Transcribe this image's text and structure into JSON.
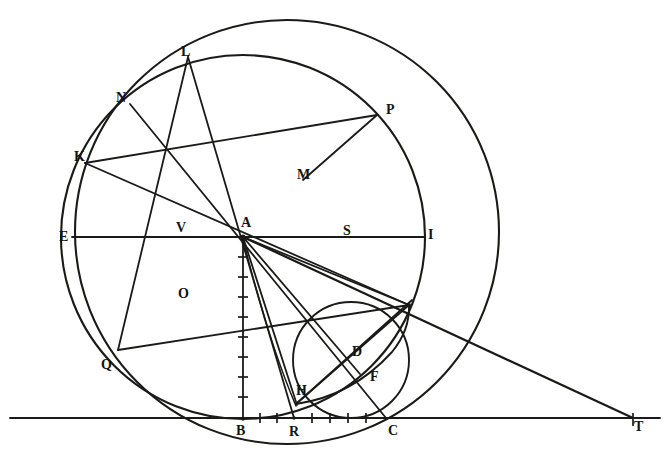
{
  "figure": {
    "kind": "geometric-construction-diagram",
    "medium": "scanned line drawing, black ink on white paper",
    "width": 667,
    "height": 465,
    "ink_color": "#1a1a18",
    "paper_color": "#ffffff"
  },
  "labels": [
    {
      "id": "L",
      "text": "L",
      "x": 181,
      "y": 45,
      "role": "circle-intersection-top"
    },
    {
      "id": "N",
      "text": "N",
      "x": 116,
      "y": 91,
      "role": "circle-point-upper-left"
    },
    {
      "id": "P",
      "text": "P",
      "x": 386,
      "y": 103,
      "role": "circle-point-upper-right"
    },
    {
      "id": "K",
      "text": "K",
      "x": 74,
      "y": 150,
      "role": "circle-point-left-upper"
    },
    {
      "id": "M",
      "text": "M",
      "x": 297,
      "y": 168,
      "role": "chord-intersection"
    },
    {
      "id": "E",
      "text": "E",
      "x": 59,
      "y": 230,
      "role": "diameter-left-end"
    },
    {
      "id": "V",
      "text": "V",
      "x": 176,
      "y": 221,
      "role": "chord-intersection-left"
    },
    {
      "id": "A",
      "text": "A",
      "x": 241,
      "y": 216,
      "role": "center"
    },
    {
      "id": "S",
      "text": "S",
      "x": 343,
      "y": 224,
      "role": "chord-intersection-right"
    },
    {
      "id": "I",
      "text": "I",
      "x": 428,
      "y": 228,
      "role": "diameter-right-end"
    },
    {
      "id": "O",
      "text": "O",
      "x": 178,
      "y": 287,
      "role": "chord-intersection-lower-left"
    },
    {
      "id": "Q",
      "text": "Q",
      "x": 101,
      "y": 358,
      "role": "circle-point-lower-left"
    },
    {
      "id": "D",
      "text": "D",
      "x": 352,
      "y": 345,
      "role": "small-circle-point"
    },
    {
      "id": "F",
      "text": "F",
      "x": 370,
      "y": 370,
      "role": "small-circle-point"
    },
    {
      "id": "H",
      "text": "H",
      "x": 296,
      "y": 384,
      "role": "near-baseline-point"
    },
    {
      "id": "B",
      "text": "B",
      "x": 236,
      "y": 424,
      "role": "tangent-point-baseline"
    },
    {
      "id": "R",
      "text": "R",
      "x": 289,
      "y": 425,
      "role": "baseline-point"
    },
    {
      "id": "C",
      "text": "C",
      "x": 388,
      "y": 424,
      "role": "baseline-point"
    },
    {
      "id": "T",
      "text": "T",
      "x": 634,
      "y": 420,
      "role": "baseline-right-end"
    }
  ],
  "points": {
    "A": {
      "x": 243,
      "y": 237
    },
    "B": {
      "x": 243,
      "y": 419
    },
    "R": {
      "x": 294,
      "y": 418
    },
    "C": {
      "x": 386,
      "y": 418
    },
    "T": {
      "x": 633,
      "y": 418
    },
    "E": {
      "x": 72,
      "y": 237
    },
    "I": {
      "x": 425,
      "y": 237
    },
    "K": {
      "x": 85,
      "y": 163
    },
    "L": {
      "x": 188,
      "y": 57
    },
    "N": {
      "x": 130,
      "y": 104
    },
    "P": {
      "x": 377,
      "y": 115
    },
    "M": {
      "x": 303,
      "y": 180
    },
    "V": {
      "x": 188,
      "y": 237
    },
    "S": {
      "x": 333,
      "y": 237
    },
    "O": {
      "x": 190,
      "y": 297
    },
    "Q": {
      "x": 118,
      "y": 350
    },
    "D": {
      "x": 358,
      "y": 356
    },
    "F": {
      "x": 358,
      "y": 372
    },
    "H": {
      "x": 299,
      "y": 403
    },
    "G": {
      "x": 408,
      "y": 305
    }
  },
  "circles": [
    {
      "name": "main-circle",
      "cx": 243,
      "cy": 237,
      "r": 182,
      "note": "centred at A, tangent to baseline at B, meets diameter at E and I"
    },
    {
      "name": "outer-circle",
      "cx": 287,
      "cy": 232,
      "r": 212,
      "note": "large circle through L, dipping below the baseline"
    },
    {
      "name": "small-circle",
      "cx": 351,
      "cy": 360,
      "r": 58,
      "note": "small circle through R, C and the right intersection point"
    }
  ],
  "segments": [
    {
      "name": "baseline",
      "from": [
        10,
        418
      ],
      "to": [
        660,
        418
      ]
    },
    {
      "name": "horizontal-diameter",
      "from": [
        72,
        237
      ],
      "to": [
        425,
        237
      ]
    },
    {
      "name": "vertical-radius-AB",
      "from": [
        243,
        237
      ],
      "to": [
        243,
        419
      ]
    },
    {
      "name": "diagonal-K-P",
      "from": [
        85,
        163
      ],
      "to": [
        377,
        115
      ]
    },
    {
      "name": "diagonal-L-Q",
      "from": [
        188,
        57
      ],
      "to": [
        118,
        350
      ]
    },
    {
      "name": "chord-N-A",
      "from": [
        130,
        104
      ],
      "to": [
        243,
        237
      ]
    },
    {
      "name": "chord-K-V",
      "from": [
        85,
        163
      ],
      "to": [
        243,
        237
      ]
    },
    {
      "name": "chord-L-M-R",
      "from": [
        188,
        57
      ],
      "to": [
        294,
        418
      ]
    },
    {
      "name": "chord-N-O-C",
      "from": [
        130,
        104
      ],
      "to": [
        386,
        418
      ]
    },
    {
      "name": "chord-M-P",
      "from": [
        303,
        180
      ],
      "to": [
        377,
        115
      ]
    },
    {
      "name": "ray-A-T",
      "from": [
        243,
        237
      ],
      "to": [
        633,
        418
      ]
    },
    {
      "name": "ray-A-G",
      "from": [
        243,
        237
      ],
      "to": [
        408,
        305
      ]
    },
    {
      "name": "ray-A-F",
      "from": [
        243,
        237
      ],
      "to": [
        358,
        372
      ]
    },
    {
      "name": "ray-A-H",
      "from": [
        243,
        237
      ],
      "to": [
        299,
        403
      ]
    },
    {
      "name": "ray-A-R",
      "from": [
        243,
        237
      ],
      "to": [
        294,
        418
      ]
    },
    {
      "name": "ray-A-C",
      "from": [
        243,
        237
      ],
      "to": [
        386,
        418
      ]
    },
    {
      "name": "line-G-H",
      "from": [
        408,
        305
      ],
      "to": [
        299,
        403
      ]
    },
    {
      "name": "line-Q-O-G",
      "from": [
        118,
        350
      ],
      "to": [
        408,
        305
      ]
    }
  ],
  "tick_marks": {
    "vertical_AB_count": 9,
    "baseline_B_to_R_count": 3,
    "baseline_R_to_C_count": 5,
    "note": "short cross-strokes marking equal divisions along segment AB and along the baseline between B, R and C"
  },
  "caption": ""
}
